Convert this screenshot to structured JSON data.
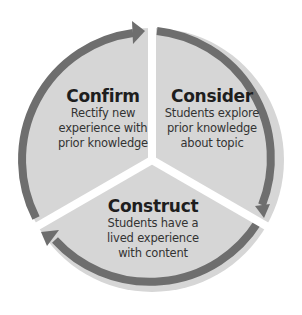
{
  "diagram": {
    "type": "cycle",
    "colors": {
      "segment_fill": "#d6d6d6",
      "arrow": "#6e6e6e",
      "gap": "#ffffff",
      "text": "#222222"
    },
    "stages": [
      {
        "title": "Consider",
        "description": [
          "Students explore",
          "prior knowledge",
          "about topic"
        ]
      },
      {
        "title": "Construct",
        "description": [
          "Students have a",
          "lived experience",
          "with content"
        ]
      },
      {
        "title": "Confirm",
        "description": [
          "Rectify new",
          "experience with",
          "prior knowledge"
        ]
      }
    ],
    "flow": [
      "Consider",
      "Construct",
      "Confirm",
      "Consider"
    ]
  }
}
